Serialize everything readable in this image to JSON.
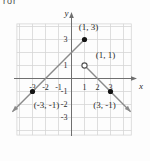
{
  "page": {
    "corner_text": "ror"
  },
  "chart_data": {
    "type": "line",
    "title": "",
    "description_of_figure": "Two rays on a coordinate grid",
    "axes": {
      "x_label": "x",
      "y_label": "y",
      "x_ticks": [
        -3,
        -2,
        -1,
        1,
        2,
        3
      ],
      "y_ticks": [
        3,
        1,
        -1,
        -2,
        -3
      ],
      "xlim": [
        -4.6,
        5.0
      ],
      "ylim": [
        -4.5,
        5.0
      ],
      "grid": true,
      "grid_step": 1
    },
    "grid_rect": {
      "x0": -4.2,
      "x1": 4.6,
      "y0": -4.35,
      "y1": 4.2
    },
    "colors": {
      "grid": "#d6d6d6",
      "axis": "#6f6f6f",
      "ray": "#8a8a8a",
      "point": "#141414",
      "open_point_stroke": "#4f4f4f",
      "text": "#2b2b2b",
      "background": "#fdfdfd"
    },
    "series": [
      {
        "name": "rising-ray",
        "from": [
          1,
          3
        ],
        "to": [
          -4.55,
          -2.55
        ],
        "arrow_at": "to",
        "points": [
          {
            "at": [
              1,
              3
            ],
            "style": "closed",
            "label": "(1, 3)",
            "label_offset": [
              4,
              -9.5
            ]
          },
          {
            "at": [
              -3,
              -1
            ],
            "style": "closed",
            "label": "(-3, -1)",
            "label_offset": [
              14,
              16
            ]
          }
        ]
      },
      {
        "name": "falling-ray",
        "from": [
          1,
          1
        ],
        "to": [
          4.55,
          -2.55
        ],
        "arrow_at": "to",
        "points": [
          {
            "at": [
              1,
              1
            ],
            "style": "open",
            "label": "(1, 1)",
            "label_offset": [
              21,
              -7.5
            ]
          },
          {
            "at": [
              3,
              -1
            ],
            "style": "closed",
            "label": "(3, -1)",
            "label_offset": [
              -6,
              16
            ]
          }
        ]
      }
    ]
  }
}
